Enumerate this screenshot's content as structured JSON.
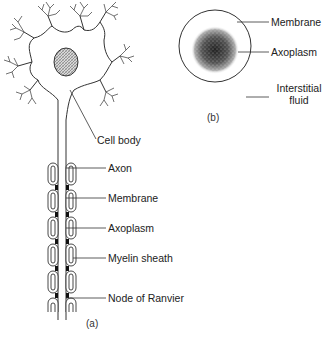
{
  "figure": {
    "panel_a": {
      "caption": "(a)",
      "labels": {
        "cell_body": "Cell body",
        "axon": "Axon",
        "membrane": "Membrane",
        "axoplasm": "Axoplasm",
        "myelin_sheath": "Myelin sheath",
        "node_of_ranvier": "Node of Ranvier"
      }
    },
    "panel_b": {
      "caption": "(b)",
      "labels": {
        "membrane": "Membrane",
        "axoplasm": "Axoplasm",
        "interstitial_line1": "Interstitial",
        "interstitial_line2": "fluid"
      }
    },
    "colors": {
      "line": "#333333",
      "nucleus_fill": "#9a9a9a",
      "node_fill": "#111111"
    }
  }
}
